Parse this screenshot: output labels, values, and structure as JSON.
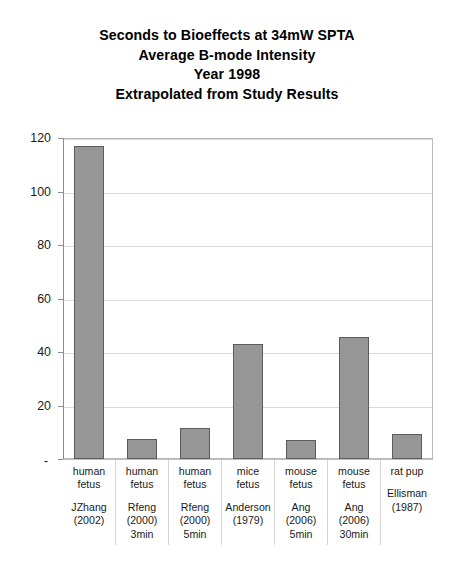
{
  "chart_data": {
    "type": "bar",
    "title": "Seconds to Bioeffects at 34mW SPTA\nAverage B-mode Intensity\nYear 1998\nExtrapolated from Study Results",
    "title_lines": [
      "Seconds to Bioeffects at 34mW SPTA",
      "Average B-mode Intensity",
      "Year 1998",
      "Extrapolated from Study Results"
    ],
    "xlabel": "",
    "ylabel": "",
    "ylim": [
      0,
      120
    ],
    "yticks": [
      0,
      20,
      40,
      60,
      80,
      100,
      120
    ],
    "ytick_labels": [
      "-",
      "20",
      "40",
      "60",
      "80",
      "100",
      "120"
    ],
    "grid": true,
    "legend": false,
    "categories": [
      "human fetus",
      "human fetus",
      "human fetus",
      "mice fetus",
      "mouse fetus",
      "mouse fetus",
      "rat pup"
    ],
    "category_citations": [
      "JZhang (2002)",
      "Rfeng (2000) 3min",
      "Rfeng (2000) 5min",
      "Anderson (1979)",
      "Ang (2006) 5min",
      "Ang (2006) 30min",
      "Ellisman (1987)"
    ],
    "values": [
      117,
      7.5,
      11.5,
      43,
      7,
      45.5,
      9.5
    ],
    "bar_color": "#969696",
    "bar_border_color": "#5c5c5c",
    "bars": [
      {
        "name_lines": [
          "human",
          "fetus"
        ],
        "citation_lines": [
          "JZhang",
          "(2002)"
        ],
        "value": 117
      },
      {
        "name_lines": [
          "human",
          "fetus"
        ],
        "citation_lines": [
          "Rfeng",
          "(2000)",
          "3min"
        ],
        "value": 7.5
      },
      {
        "name_lines": [
          "human",
          "fetus"
        ],
        "citation_lines": [
          "Rfeng",
          "(2000)",
          "5min"
        ],
        "value": 11.5
      },
      {
        "name_lines": [
          "mice",
          "fetus"
        ],
        "citation_lines": [
          "Anderson",
          "(1979)"
        ],
        "value": 43
      },
      {
        "name_lines": [
          "mouse",
          "fetus"
        ],
        "citation_lines": [
          "Ang",
          "(2006)",
          "5min"
        ],
        "value": 7
      },
      {
        "name_lines": [
          "mouse",
          "fetus"
        ],
        "citation_lines": [
          "Ang",
          "(2006)",
          "30min"
        ],
        "value": 45.5
      },
      {
        "name_lines": [
          "rat pup"
        ],
        "citation_lines": [
          "Ellisman",
          "(1987)"
        ],
        "value": 9.5
      }
    ]
  },
  "title": {
    "line1": "Seconds to Bioeffects at 34mW SPTA",
    "line2": "Average B-mode Intensity",
    "line3": "Year 1998",
    "line4": "Extrapolated from Study Results"
  },
  "axis": {
    "y_labels": [
      "120",
      "100",
      "80",
      "60",
      "40",
      "20"
    ],
    "zero_label": "-"
  },
  "colors": {
    "bar_fill": "#969696",
    "bar_stroke": "#5c5c5c",
    "gridline": "#d9d9d9",
    "axis": "#8c8c8c",
    "plot_border": "#b9b9b9",
    "text": "#000000",
    "background": "#ffffff"
  }
}
